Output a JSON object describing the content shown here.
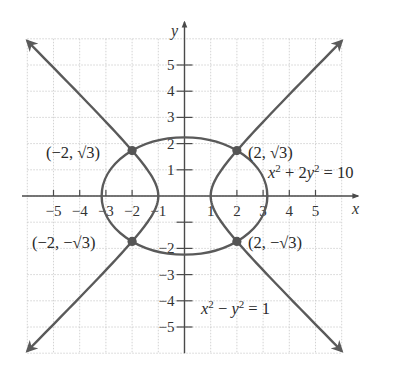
{
  "chart_data": {
    "type": "line",
    "title": "",
    "xlabel": "x",
    "ylabel": "y",
    "xlim": [
      -6,
      6
    ],
    "ylim": [
      -6,
      6
    ],
    "grid": true,
    "x_ticks": [
      -5,
      -4,
      -3,
      -2,
      -1,
      1,
      2,
      3,
      4,
      5
    ],
    "y_ticks": [
      -5,
      -4,
      -3,
      -2,
      -1,
      1,
      2,
      3,
      4,
      5
    ],
    "x_tick_labels": [
      "−5",
      "−4",
      "−3",
      "−2",
      "−1",
      "1",
      "2",
      "3",
      "4",
      "5"
    ],
    "y_tick_labels": [
      "−5",
      "−4",
      "−3",
      "−2",
      "1",
      "2",
      "3",
      "4",
      "5"
    ],
    "series": [
      {
        "name": "x² + 2y² = 10",
        "kind": "ellipse",
        "center": [
          0,
          0
        ],
        "semi_axes": [
          3.1623,
          2.2361
        ]
      },
      {
        "name": "x² − y² = 1",
        "kind": "hyperbola",
        "a": 1,
        "b": 1,
        "x_extent": 6,
        "arrows": true
      }
    ],
    "points": [
      {
        "x": -2,
        "y": 1.732,
        "label": "(−2, √3)"
      },
      {
        "x": 2,
        "y": 1.732,
        "label": "(2, √3)"
      },
      {
        "x": -2,
        "y": -1.732,
        "label": "(−2, −√3)"
      },
      {
        "x": 2,
        "y": -1.732,
        "label": "(2, −√3)"
      }
    ],
    "annotations": [
      {
        "text": "x² + 2y² = 10",
        "near": [
          3.2,
          0.8
        ]
      },
      {
        "text": "x² − y² = 1",
        "near": [
          0.6,
          -4.5
        ]
      }
    ]
  },
  "labels": {
    "x_axis": "x",
    "y_axis": "y",
    "ellipse_eq": {
      "x": "x",
      "exp1": "2",
      "mid": " + 2",
      "y": "y",
      "exp2": "2",
      "rhs": " = 10"
    },
    "hyperbola_eq": {
      "x": "x",
      "exp1": "2",
      "mid": " − ",
      "y": "y",
      "exp2": "2",
      "rhs": " = 1"
    },
    "point_labels": [
      "(−2, √3)",
      "(2, √3)",
      "(−2, −√3)",
      "(2, −√3)"
    ]
  },
  "style": {
    "curve_color": "#5a5a5a",
    "axis_color": "#4a4a4a",
    "grid_color": "#c8c8c8",
    "dot_color": "#555555"
  }
}
